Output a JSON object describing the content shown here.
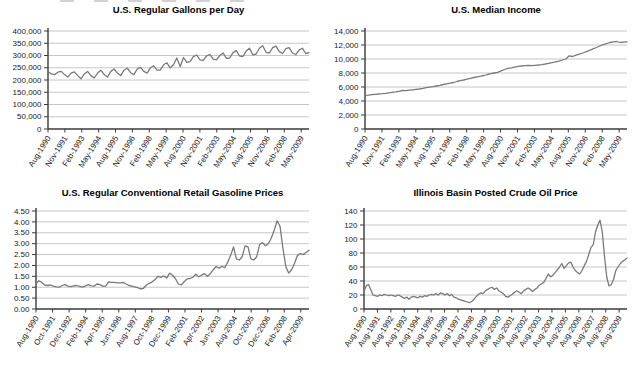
{
  "chart_data": [
    {
      "type": "line",
      "title": "U.S. Regular Gallons per Day",
      "xlabel": "",
      "ylabel": "",
      "grid": true,
      "legend": "none",
      "line_color": "#7a7a7a",
      "ylim": [
        0,
        400000
      ],
      "y_tick_labels": [
        "0",
        "50,000",
        "100,000",
        "150,000",
        "200,000",
        "250,000",
        "300,000",
        "350,000",
        "400,000"
      ],
      "x_labels": [
        "Aug-1990",
        "Nov-1991",
        "Feb-1993",
        "May-1994",
        "Aug-1995",
        "Nov-1996",
        "Feb-1998",
        "May-1999",
        "Aug-2000",
        "Nov-2001",
        "Feb-2003",
        "May-2004",
        "Aug-2005",
        "Nov-2006",
        "Feb-2008",
        "May-2009"
      ],
      "values": [
        235000,
        225000,
        222000,
        232000,
        235000,
        222000,
        212000,
        228000,
        233000,
        218000,
        205000,
        225000,
        235000,
        218000,
        208000,
        228000,
        240000,
        222000,
        212000,
        235000,
        245000,
        228000,
        218000,
        240000,
        248000,
        230000,
        222000,
        245000,
        252000,
        235000,
        228000,
        250000,
        258000,
        240000,
        240000,
        262000,
        270000,
        250000,
        262000,
        290000,
        255000,
        292000,
        272000,
        275000,
        295000,
        302000,
        282000,
        280000,
        298000,
        305000,
        285000,
        282000,
        300000,
        310000,
        288000,
        290000,
        312000,
        320000,
        298000,
        296000,
        318000,
        330000,
        303000,
        306000,
        330000,
        340000,
        313000,
        310000,
        332000,
        338000,
        316000,
        308000,
        328000,
        332000,
        310000,
        304000,
        322000,
        330000,
        308000,
        312000
      ]
    },
    {
      "type": "line",
      "title": "U.S. Median Income",
      "xlabel": "",
      "ylabel": "",
      "grid": true,
      "legend": "none",
      "line_color": "#7a7a7a",
      "ylim": [
        0,
        14000
      ],
      "y_tick_labels": [
        "0",
        "2,000",
        "4,000",
        "6,000",
        "8,000",
        "10,000",
        "12,000",
        "14,000"
      ],
      "x_labels": [
        "Aug-1990",
        "Nov-1991",
        "Feb-1993",
        "May-1994",
        "Aug-1995",
        "Nov-1996",
        "Feb-1998",
        "May-1999",
        "Aug-2000",
        "Nov-2001",
        "Feb-2003",
        "May-2004",
        "Aug-2005",
        "Nov-2006",
        "Feb-2008",
        "May-2009"
      ],
      "values": [
        4800,
        4850,
        4900,
        4950,
        5000,
        5050,
        5100,
        5170,
        5240,
        5300,
        5380,
        5500,
        5480,
        5550,
        5600,
        5650,
        5720,
        5800,
        5900,
        5980,
        6050,
        6150,
        6250,
        6350,
        6450,
        6550,
        6650,
        6780,
        6900,
        7000,
        7120,
        7250,
        7350,
        7450,
        7550,
        7650,
        7780,
        7900,
        8000,
        8100,
        8300,
        8500,
        8650,
        8750,
        8850,
        8950,
        9000,
        9050,
        9080,
        9050,
        9100,
        9150,
        9200,
        9280,
        9380,
        9480,
        9580,
        9700,
        9850,
        10000,
        10450,
        10350,
        10550,
        10700,
        10850,
        11050,
        11250,
        11450,
        11650,
        11850,
        12050,
        12200,
        12350,
        12450,
        12500,
        12350,
        12400,
        12450
      ]
    },
    {
      "type": "line",
      "title": "U.S. Regular Conventional Retail Gasoline Prices",
      "xlabel": "",
      "ylabel": "",
      "grid": true,
      "legend": "none",
      "line_color": "#7a7a7a",
      "ylim": [
        0,
        4.5
      ],
      "y_tick_labels": [
        "0.00",
        "0.50",
        "1.00",
        "1.50",
        "2.00",
        "2.50",
        "3.00",
        "3.50",
        "4.00",
        "4.50"
      ],
      "x_labels": [
        "Aug-1990",
        "Oct-1991",
        "Dec-1992",
        "Feb-1994",
        "Apr-1995",
        "Jun-1996",
        "Aug-1997",
        "Oct-1998",
        "Dec-1999",
        "Feb-2001",
        "Apr-2002",
        "Jun-2003",
        "Aug-2004",
        "Oct-2005",
        "Dec-2006",
        "Feb-2008",
        "Apr-2009"
      ],
      "values": [
        1.16,
        1.3,
        1.22,
        1.1,
        1.08,
        1.1,
        1.05,
        1.02,
        1.0,
        1.08,
        1.12,
        1.05,
        1.03,
        1.06,
        1.08,
        1.04,
        1.0,
        1.06,
        1.12,
        1.06,
        1.05,
        1.15,
        1.12,
        1.05,
        1.05,
        1.25,
        1.22,
        1.22,
        1.2,
        1.2,
        1.22,
        1.15,
        1.08,
        1.05,
        1.02,
        0.98,
        0.92,
        0.95,
        1.1,
        1.18,
        1.25,
        1.35,
        1.5,
        1.45,
        1.52,
        1.42,
        1.65,
        1.55,
        1.4,
        1.15,
        1.1,
        1.25,
        1.38,
        1.4,
        1.45,
        1.6,
        1.48,
        1.55,
        1.62,
        1.5,
        1.62,
        1.8,
        1.95,
        1.88,
        1.95,
        1.9,
        2.15,
        2.45,
        2.85,
        2.3,
        2.25,
        2.4,
        2.9,
        2.85,
        2.3,
        2.25,
        2.4,
        2.95,
        3.05,
        2.9,
        3.0,
        3.25,
        3.6,
        4.05,
        3.8,
        2.8,
        1.95,
        1.65,
        1.8,
        2.1,
        2.45,
        2.55,
        2.5,
        2.6,
        2.7
      ]
    },
    {
      "type": "line",
      "title": "Illinois Basin Posted Crude Oil Price",
      "xlabel": "",
      "ylabel": "",
      "grid": true,
      "legend": "none",
      "line_color": "#7a7a7a",
      "ylim": [
        0,
        140
      ],
      "y_tick_labels": [
        "0",
        "20",
        "40",
        "60",
        "80",
        "100",
        "120",
        "140"
      ],
      "x_labels": [
        "Aug-1990",
        "Aug-1991",
        "Aug-1992",
        "Aug-1993",
        "Aug-1994",
        "Aug-1995",
        "Aug-1996",
        "Aug-1997",
        "Aug-1998",
        "Aug-1999",
        "Aug-2000",
        "Aug-2001",
        "Aug-2002",
        "Aug-2003",
        "Aug-2004",
        "Aug-2005",
        "Aug-2006",
        "Aug-2007",
        "Aug-2008",
        "Aug-2009"
      ],
      "values": [
        25,
        33,
        35,
        28,
        20,
        19,
        18,
        20,
        19,
        21,
        20,
        19,
        20,
        19,
        18,
        20,
        19,
        17,
        15,
        17,
        14,
        17,
        18,
        17,
        16,
        18,
        17,
        19,
        18,
        20,
        21,
        20,
        22,
        20,
        23,
        22,
        20,
        22,
        19,
        21,
        17,
        16,
        14,
        13,
        12,
        11,
        10,
        9,
        11,
        14,
        18,
        21,
        23,
        22,
        26,
        28,
        30,
        31,
        28,
        30,
        26,
        24,
        22,
        18,
        17,
        19,
        21,
        24,
        26,
        24,
        22,
        26,
        28,
        30,
        28,
        25,
        28,
        30,
        34,
        36,
        38,
        44,
        50,
        46,
        48,
        52,
        56,
        60,
        65,
        58,
        62,
        66,
        67,
        60,
        55,
        52,
        50,
        55,
        62,
        68,
        78,
        88,
        92,
        110,
        120,
        127,
        110,
        75,
        45,
        33,
        35,
        42,
        55,
        60,
        65,
        68,
        70,
        73
      ]
    }
  ],
  "styles": {
    "grid_color": "#b8b8b8",
    "axis_color": "#3a3a3a",
    "text_color": "#1a1a1a"
  }
}
